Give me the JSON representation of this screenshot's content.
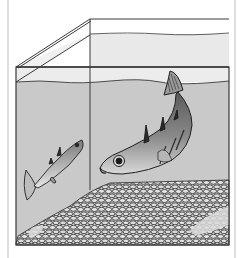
{
  "illustration": {
    "subject": "Aquarium with two stickleback fish",
    "elements": {
      "tank": "glass-aquarium",
      "water": "water",
      "gravel": "gravel-bed",
      "large_fish": "stickleback-male-large",
      "small_fish": "stickleback-small"
    }
  },
  "colors": {
    "background": "#ffffff",
    "air": "#ececec",
    "water": "#c9c9c9",
    "outline": "#3a3a3a",
    "gravel_fill": "#d4d4d4",
    "gravel_stroke": "#2c2c2c",
    "frame_line": "#bdbdbd"
  }
}
